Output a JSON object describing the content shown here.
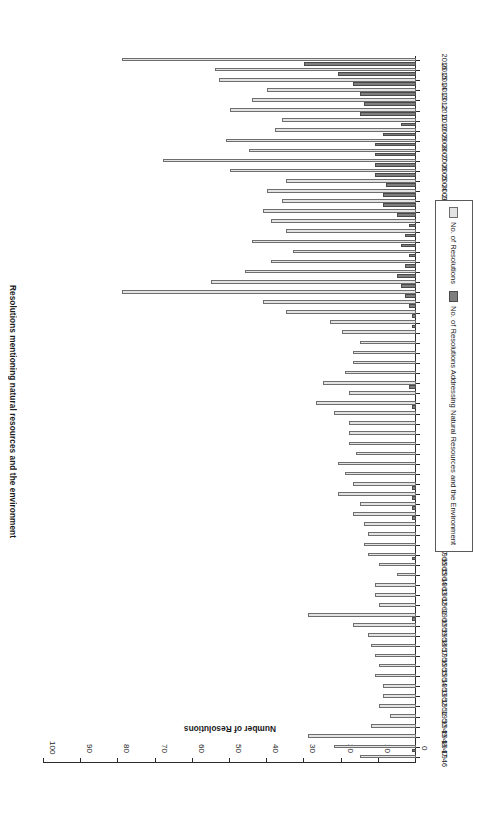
{
  "chart_data": {
    "type": "bar",
    "orientation": "horizontal",
    "title": "Resolutions mentioning natural resources and the environment",
    "xlabel": "Number of Resolutions",
    "ylabel": "",
    "xlim": [
      0,
      100
    ],
    "xticks": [
      0,
      10,
      20,
      30,
      40,
      50,
      60,
      70,
      80,
      90,
      100
    ],
    "grid": false,
    "legend_position": "inside-left",
    "rotated_180": true,
    "categories": [
      "1946",
      "1947",
      "1948",
      "1949",
      "1950",
      "1951",
      "1952",
      "1953",
      "1954",
      "1955",
      "1956",
      "1957",
      "1958",
      "1959",
      "1960",
      "1961",
      "1962",
      "1963",
      "1964",
      "1965",
      "1966",
      "1967",
      "1968",
      "1969",
      "1970",
      "1971",
      "1972",
      "1973",
      "1974",
      "1975",
      "1976",
      "1977",
      "1978",
      "1979",
      "1980",
      "1981",
      "1982",
      "1983",
      "1985",
      "1986",
      "1987",
      "1988",
      "1989",
      "1990",
      "1991",
      "1992",
      "1993",
      "1994",
      "1995",
      "1996",
      "1997",
      "1998",
      "1999",
      "2000",
      "2001",
      "2002",
      "2003",
      "2004",
      "2005",
      "2006",
      "2007",
      "2008",
      "2009",
      "2010",
      "2011",
      "2012",
      "2013",
      "2014",
      "2015",
      "2016"
    ],
    "series": [
      {
        "name": "No. of Resolutions",
        "color": "#e3e3e3",
        "values": [
          15,
          22,
          29,
          12,
          7,
          10,
          9,
          9,
          11,
          10,
          11,
          12,
          13,
          17,
          29,
          10,
          11,
          11,
          5,
          10,
          13,
          14,
          13,
          14,
          17,
          15,
          21,
          17,
          19,
          21,
          16,
          18,
          18,
          18,
          22,
          27,
          18,
          25,
          19,
          17,
          17,
          15,
          20,
          23,
          35,
          41,
          79,
          55,
          46,
          39,
          33,
          44,
          35,
          39,
          41,
          36,
          40,
          35,
          50,
          68,
          45,
          51,
          38,
          36,
          50,
          44,
          40,
          53,
          54,
          79
        ]
      },
      {
        "name": "No. of Resolutions Addressing Natural Resources and the Environment",
        "color": "#7e7e7e",
        "values": [
          0,
          1,
          0,
          0,
          0,
          0,
          0,
          0,
          0,
          0,
          0,
          0,
          0,
          0,
          1,
          0,
          0,
          0,
          0,
          0,
          1,
          0,
          0,
          0,
          1,
          1,
          1,
          1,
          0,
          0,
          0,
          0,
          0,
          0,
          0,
          1,
          0,
          2,
          0,
          0,
          0,
          0,
          0,
          1,
          1,
          2,
          3,
          4,
          5,
          3,
          2,
          4,
          3,
          2,
          5,
          9,
          9,
          8,
          11,
          11,
          11,
          11,
          9,
          4,
          15,
          14,
          15,
          17,
          21,
          30
        ]
      }
    ]
  },
  "legend": {
    "items": [
      {
        "label": "No. of Resolutions",
        "swatch": "total"
      },
      {
        "label": "No. of Resolutions Addressing Natural Resources and the Environment",
        "swatch": "sub"
      }
    ]
  }
}
